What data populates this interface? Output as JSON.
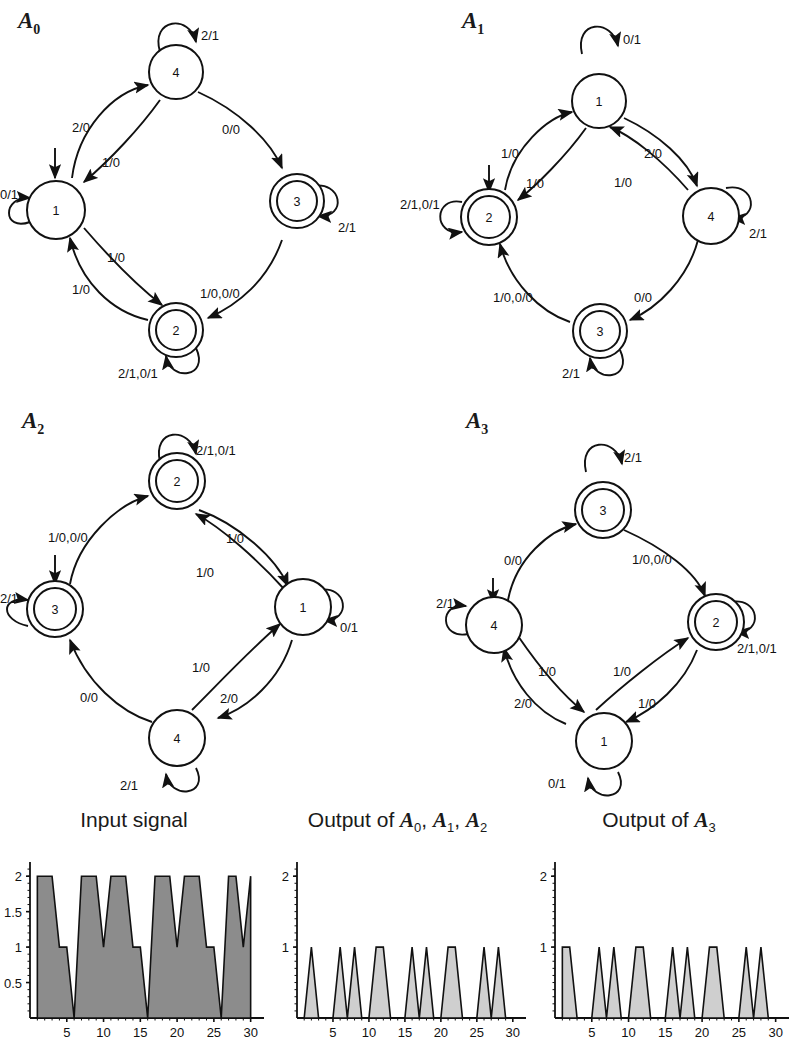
{
  "automata": [
    {
      "id": "A0",
      "title": "A",
      "subscript": "0",
      "start_state": "1",
      "states": [
        {
          "name": "1",
          "accepting": false,
          "pos": "left"
        },
        {
          "name": "4",
          "accepting": false,
          "pos": "top"
        },
        {
          "name": "3",
          "accepting": true,
          "pos": "right"
        },
        {
          "name": "2",
          "accepting": true,
          "pos": "bottom"
        }
      ],
      "self_loops": [
        {
          "state": "4",
          "label": "2/1"
        },
        {
          "state": "1",
          "label": "0/1"
        },
        {
          "state": "3",
          "label": "2/1"
        },
        {
          "state": "2",
          "label": "2/1,0/1"
        }
      ],
      "edges": [
        {
          "from": "1",
          "to": "4",
          "label": "2/0"
        },
        {
          "from": "4",
          "to": "1",
          "label": "1/0"
        },
        {
          "from": "4",
          "to": "3",
          "label": "0/0"
        },
        {
          "from": "3",
          "to": "2",
          "label": "1/0,0/0"
        },
        {
          "from": "2",
          "to": "1",
          "label": "1/0"
        },
        {
          "from": "1",
          "to": "2",
          "label": "1/0"
        }
      ]
    },
    {
      "id": "A1",
      "title": "A",
      "subscript": "1",
      "start_state": "2",
      "states": [
        {
          "name": "2",
          "accepting": true,
          "pos": "left"
        },
        {
          "name": "1",
          "accepting": false,
          "pos": "top"
        },
        {
          "name": "4",
          "accepting": false,
          "pos": "right"
        },
        {
          "name": "3",
          "accepting": true,
          "pos": "bottom"
        }
      ],
      "self_loops": [
        {
          "state": "1",
          "label": "0/1"
        },
        {
          "state": "2",
          "label": "2/1,0/1"
        },
        {
          "state": "4",
          "label": "2/1"
        },
        {
          "state": "3",
          "label": "2/1"
        }
      ],
      "edges": [
        {
          "from": "2",
          "to": "1",
          "label": "1/0"
        },
        {
          "from": "1",
          "to": "2",
          "label": "1/0"
        },
        {
          "from": "1",
          "to": "4",
          "label": "2/0"
        },
        {
          "from": "4",
          "to": "1",
          "label": "1/0"
        },
        {
          "from": "4",
          "to": "3",
          "label": "0/0"
        },
        {
          "from": "3",
          "to": "2",
          "label": "1/0,0/0"
        }
      ]
    },
    {
      "id": "A2",
      "title": "A",
      "subscript": "2",
      "start_state": "3",
      "states": [
        {
          "name": "3",
          "accepting": true,
          "pos": "left"
        },
        {
          "name": "2",
          "accepting": true,
          "pos": "top"
        },
        {
          "name": "1",
          "accepting": false,
          "pos": "right"
        },
        {
          "name": "4",
          "accepting": false,
          "pos": "bottom"
        }
      ],
      "self_loops": [
        {
          "state": "2",
          "label": "2/1,0/1"
        },
        {
          "state": "3",
          "label": "2/1"
        },
        {
          "state": "1",
          "label": "0/1"
        },
        {
          "state": "4",
          "label": "2/1"
        }
      ],
      "edges": [
        {
          "from": "3",
          "to": "2",
          "label": "1/0,0/0"
        },
        {
          "from": "2",
          "to": "1",
          "label": "1/0"
        },
        {
          "from": "1",
          "to": "2",
          "label": "1/0"
        },
        {
          "from": "1",
          "to": "4",
          "label": "2/0"
        },
        {
          "from": "4",
          "to": "1",
          "label": "1/0"
        },
        {
          "from": "4",
          "to": "3",
          "label": "0/0"
        }
      ]
    },
    {
      "id": "A3",
      "title": "A",
      "subscript": "3",
      "start_state": "4",
      "states": [
        {
          "name": "4",
          "accepting": false,
          "pos": "left"
        },
        {
          "name": "3",
          "accepting": true,
          "pos": "top"
        },
        {
          "name": "2",
          "accepting": true,
          "pos": "right"
        },
        {
          "name": "1",
          "accepting": false,
          "pos": "bottom"
        }
      ],
      "self_loops": [
        {
          "state": "3",
          "label": "2/1"
        },
        {
          "state": "4",
          "label": "2/1"
        },
        {
          "state": "2",
          "label": "2/1,0/1"
        },
        {
          "state": "1",
          "label": "0/1"
        }
      ],
      "edges": [
        {
          "from": "4",
          "to": "3",
          "label": "0/0"
        },
        {
          "from": "3",
          "to": "2",
          "label": "1/0,0/0"
        },
        {
          "from": "2",
          "to": "1",
          "label": "1/0"
        },
        {
          "from": "1",
          "to": "2",
          "label": "1/0"
        },
        {
          "from": "1",
          "to": "4",
          "label": "2/0"
        },
        {
          "from": "4",
          "to": "1",
          "label": "1/0"
        }
      ]
    }
  ],
  "labels": {
    "a0": "A0",
    "a1": "A1",
    "a2": "A2",
    "a3": "A3",
    "e_2_0": "2/0",
    "e_1_0": "1/0",
    "e_0_0": "0/0",
    "e_0_1": "0/1",
    "e_2_1": "2/1",
    "e_10_00": "1/0,0/0",
    "e_21_01": "2/1,0/1"
  },
  "chart_data": [
    {
      "type": "area",
      "title": "Input signal",
      "xlabel": "",
      "ylabel": "",
      "xlim": [
        0,
        31
      ],
      "ylim": [
        0,
        2.2
      ],
      "xticks": [
        5,
        10,
        15,
        20,
        25,
        30
      ],
      "yticks": [
        0.5,
        1,
        1.5,
        2
      ],
      "ytick_labels": [
        "0.5",
        "1",
        "1.5",
        "2"
      ],
      "grid": false,
      "x": [
        1,
        2,
        3,
        4,
        5,
        6,
        7,
        8,
        9,
        10,
        11,
        12,
        13,
        14,
        15,
        16,
        17,
        18,
        19,
        20,
        21,
        22,
        23,
        24,
        25,
        26,
        27,
        28,
        29,
        30
      ],
      "values": [
        2,
        2,
        2,
        1,
        1,
        0,
        2,
        2,
        2,
        1,
        2,
        2,
        2,
        1,
        1,
        0,
        2,
        2,
        2,
        1,
        2,
        2,
        2,
        1,
        1,
        0,
        2,
        2,
        1,
        2
      ]
    },
    {
      "type": "area",
      "title": "Output of A0, A1, A2",
      "title_parts": [
        "Output of ",
        "A",
        "0",
        ", ",
        "A",
        "1",
        ", ",
        "A",
        "2"
      ],
      "xlabel": "",
      "ylabel": "",
      "xlim": [
        0,
        31
      ],
      "ylim": [
        0,
        2.2
      ],
      "xticks": [
        5,
        10,
        15,
        20,
        25,
        30
      ],
      "yticks": [
        1,
        2
      ],
      "ytick_labels": [
        "1",
        "2"
      ],
      "grid": false,
      "x": [
        1,
        2,
        3,
        4,
        5,
        6,
        7,
        8,
        9,
        10,
        11,
        12,
        13,
        14,
        15,
        16,
        17,
        18,
        19,
        20,
        21,
        22,
        23,
        24,
        25,
        26,
        27,
        28,
        29,
        30
      ],
      "values": [
        0,
        1,
        0,
        0,
        0,
        1,
        0,
        1,
        0,
        0,
        1,
        1,
        0,
        0,
        0,
        1,
        0,
        1,
        0,
        0,
        1,
        1,
        0,
        0,
        0,
        1,
        0,
        1,
        0,
        0
      ]
    },
    {
      "type": "area",
      "title": "Output of A3",
      "title_parts": [
        "Output of ",
        "A",
        "3"
      ],
      "xlabel": "",
      "ylabel": "",
      "xlim": [
        0,
        31
      ],
      "ylim": [
        0,
        2.2
      ],
      "xticks": [
        5,
        10,
        15,
        20,
        25,
        30
      ],
      "yticks": [
        1,
        2
      ],
      "ytick_labels": [
        "1",
        "2"
      ],
      "grid": false,
      "x": [
        1,
        2,
        3,
        4,
        5,
        6,
        7,
        8,
        9,
        10,
        11,
        12,
        13,
        14,
        15,
        16,
        17,
        18,
        19,
        20,
        21,
        22,
        23,
        24,
        25,
        26,
        27,
        28,
        29,
        30
      ],
      "values": [
        1,
        1,
        0,
        0,
        0,
        1,
        0,
        1,
        0,
        0,
        1,
        1,
        0,
        0,
        0,
        1,
        0,
        1,
        0,
        0,
        1,
        1,
        0,
        0,
        0,
        1,
        0,
        1,
        0,
        0
      ]
    }
  ],
  "chart_titles": {
    "input": "Input signal",
    "output_a012_pre": "Output of ",
    "output_a3_pre": "Output of "
  }
}
